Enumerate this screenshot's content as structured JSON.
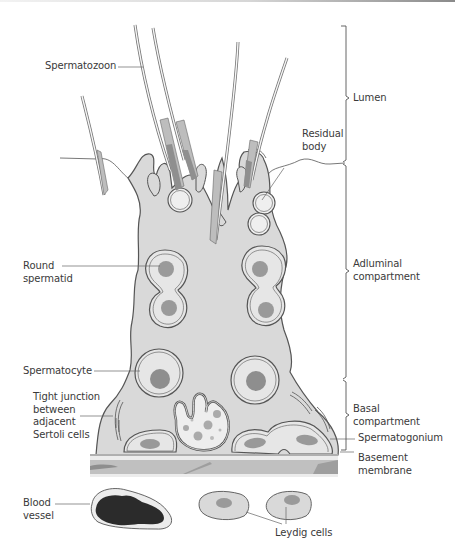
{
  "figure": {
    "colors": {
      "cytoplasm": "#d9d9d9",
      "outline": "#555555",
      "nucleus": "#9a9a9a",
      "basement_membrane": "#c2c2c2",
      "basement_dark": "#8f8f8f",
      "blood": "#2b2b2b",
      "sperm_midpiece": "#bdbdbd",
      "sperm_head": "#9c9c9c"
    }
  },
  "labels": {
    "spermatozoon": "Spermatozoon",
    "residual_body": "Residual\nbody",
    "round_spermatid": "Round\nspermatid",
    "spermatocyte": "Spermatocyte",
    "tight_junction": "Tight junction\nbetween\nadjacent\nSertoli cells",
    "blood_vessel": "Blood\nvessel",
    "leydig_cells": "Leydig cells",
    "spermatogonium": "Spermatogonium",
    "basement_membrane": "Basement\nmembrane"
  },
  "brackets": {
    "lumen": "Lumen",
    "adluminal": "Adluminal\ncompartment",
    "basal": "Basal\ncompartment"
  }
}
